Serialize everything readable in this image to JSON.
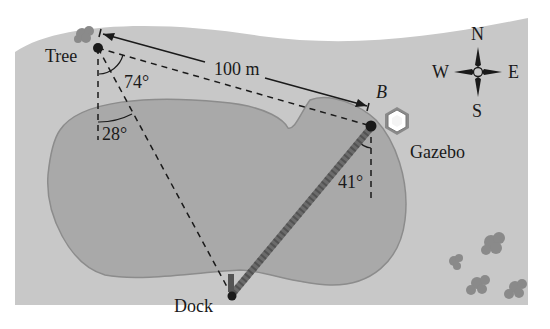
{
  "diagram": {
    "colors": {
      "page": "#ffffff",
      "land": "#c8c8c8",
      "lake": "#a9a9a9",
      "lake_edge": "#8c8c8c",
      "ink": "#1a1a1a",
      "path": "#6b6b6b",
      "shrub": "#8a8a8a"
    },
    "points": {
      "tree": {
        "label": "Tree",
        "x": 98,
        "y": 48
      },
      "gazebo_point": {
        "label": "B",
        "x": 371,
        "y": 126
      },
      "gazebo": {
        "label": "Gazebo"
      },
      "dock": {
        "label": "Dock",
        "x": 232,
        "y": 296
      }
    },
    "measurements": {
      "distance_tree_to_b": "100 m",
      "angle_at_tree_between_b_and_dock": "74°",
      "angle_at_tree_from_south_to_dock": "28°",
      "angle_at_b_from_south_to_dock": "41°"
    },
    "compass": {
      "north": "N",
      "south": "S",
      "east": "E",
      "west": "W"
    }
  }
}
